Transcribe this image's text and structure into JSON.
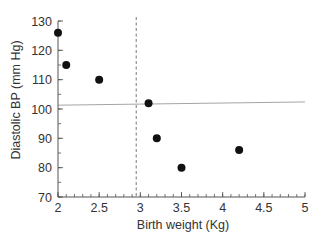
{
  "chart_data": {
    "type": "scatter",
    "title": "",
    "xlabel": "Birth weight (Kg)",
    "ylabel": "Diastolic BP (mm Hg)",
    "xlim": [
      2,
      5
    ],
    "ylim": [
      70,
      130
    ],
    "x_ticks": [
      2,
      2.5,
      3,
      3.5,
      4,
      4.5,
      5
    ],
    "x_tick_labels": [
      "2",
      "2.5",
      "3",
      "3.5",
      "4",
      "4.5",
      "5"
    ],
    "x_minor_step": 0.1,
    "y_ticks": [
      70,
      80,
      90,
      100,
      110,
      120,
      130
    ],
    "y_tick_labels": [
      "70",
      "80",
      "90",
      "100",
      "110",
      "120",
      "130"
    ],
    "y_minor_step": 5,
    "grid": false,
    "legend": null,
    "series": [
      {
        "name": "Subjects",
        "marker": "filled-circle",
        "color": "#111111",
        "points": [
          {
            "x": 2.0,
            "y": 126
          },
          {
            "x": 2.1,
            "y": 115
          },
          {
            "x": 2.5,
            "y": 110
          },
          {
            "x": 3.1,
            "y": 102
          },
          {
            "x": 3.2,
            "y": 90
          },
          {
            "x": 3.5,
            "y": 80
          },
          {
            "x": 4.2,
            "y": 86
          }
        ]
      }
    ],
    "reference_lines": [
      {
        "orientation": "vertical",
        "x": 2.95,
        "style": "dashed",
        "color": "#666666"
      },
      {
        "orientation": "horizontal",
        "y_start": 101.3,
        "y_end": 102.4,
        "style": "solid-light",
        "color": "#9a9a9a"
      }
    ]
  },
  "colors": {
    "axis": "#555555",
    "text": "#333333",
    "marker": "#111111"
  }
}
